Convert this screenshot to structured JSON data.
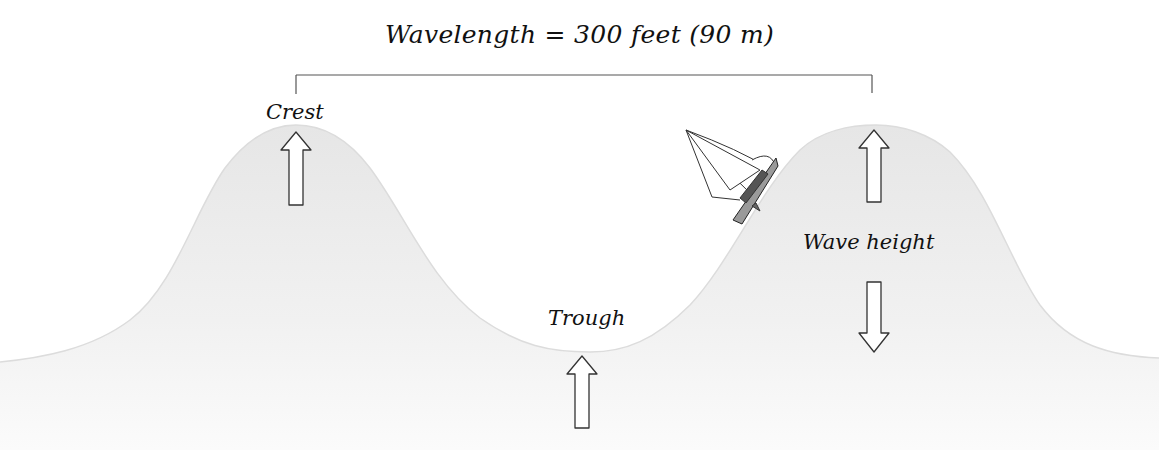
{
  "diagram": {
    "title": "Wavelength = 300 feet (90 m)",
    "labels": {
      "crest": "Crest",
      "trough": "Trough",
      "wave_height": "Wave height"
    },
    "colors": {
      "background": "#ffffff",
      "wave_fill": "#ececec",
      "outline": "#333333",
      "text": "#111111"
    },
    "elements": {
      "bracket": "wavelength-bracket",
      "arrows": [
        {
          "name": "crest-arrow",
          "direction": "up"
        },
        {
          "name": "wave-height-up-arrow",
          "direction": "up"
        },
        {
          "name": "wave-height-down-arrow",
          "direction": "down"
        },
        {
          "name": "trough-arrow",
          "direction": "up"
        }
      ],
      "boat": "sailboat"
    }
  }
}
